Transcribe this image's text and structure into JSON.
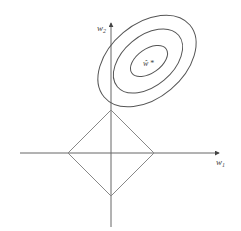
{
  "diagram": {
    "colors": {
      "background": "#ffffff",
      "stroke": "#555555",
      "axis": "#666666",
      "diamond": "#888888"
    },
    "axes": {
      "x_label": "w",
      "x_subscript": "1",
      "y_label": "w",
      "y_subscript": "2"
    },
    "optimum": {
      "label": "ŵ",
      "marker": "*"
    },
    "contours": [
      {
        "name": "outer",
        "cx": 147,
        "cy": 61,
        "rx": 56,
        "ry": 37,
        "rotate": -40
      },
      {
        "name": "middle",
        "cx": 148,
        "cy": 61,
        "rx": 40,
        "ry": 25,
        "rotate": -40
      },
      {
        "name": "inner",
        "cx": 149,
        "cy": 61,
        "rx": 21,
        "ry": 14,
        "rotate": -40
      }
    ],
    "constraint": {
      "shape": "diamond",
      "center": [
        111,
        153
      ],
      "radius": 43
    }
  }
}
